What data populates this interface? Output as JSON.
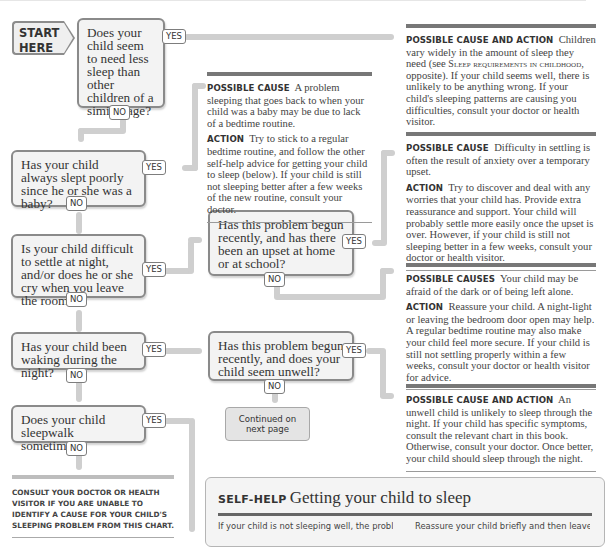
{
  "start": {
    "line1": "START",
    "line2": "HERE"
  },
  "questions": [
    {
      "id": "q1",
      "text": "Does your child seem to need less sleep than other children of a similar age?",
      "yes": "YES",
      "no": "NO"
    },
    {
      "id": "q2",
      "text": "Has your child always slept poorly since he or she was a baby?",
      "yes": "YES",
      "no": "NO"
    },
    {
      "id": "q3",
      "text": "Is your child difficult to settle at night, and/or does he or she cry when you leave the room?",
      "yes": "YES",
      "no": "NO"
    },
    {
      "id": "q4",
      "text": "Has your child been waking during the night?",
      "yes": "YES",
      "no": "NO"
    },
    {
      "id": "q5",
      "text": "Does your child sleepwalk sometimes?",
      "yes": "YES",
      "no": "NO"
    },
    {
      "id": "q6",
      "text": "Has this problem begun recently, and has there been an upset at home or at school?",
      "yes": "YES",
      "no": "NO"
    },
    {
      "id": "q7",
      "text": "Has this problem begun recently, and does your child seem unwell?",
      "yes": "YES",
      "no": "NO"
    }
  ],
  "advice": {
    "need_less_sleep": {
      "label": "Possible cause and action",
      "text_a": "Children vary widely in the amount of sleep they need (see ",
      "ref": "Sleep requirements in childhood",
      "text_b": ", opposite). If your child seems well, there is unlikely to be anything wrong. If your child's sleeping patterns are causing you difficulties, consult your doctor or health visitor."
    },
    "since_baby": {
      "cause_label": "Possible cause",
      "cause_text": "A problem sleeping that goes back to when your child was a baby may be due to lack of a bedtime routine.",
      "action_label": "Action",
      "action_text": "Try to stick to a regular bedtime routine, and follow the other self-help advice for getting your child to sleep (below). If your child is still not sleeping better after a few weeks of the new routine, consult your doctor."
    },
    "upset": {
      "cause_label": "Possible cause",
      "cause_text": "Difficulty in settling is often the result of anxiety over a temporary upset.",
      "action_label": "Action",
      "action_text": "Try to discover and deal with any worries that your child has. Provide extra reassurance and support. Your child will probably settle more easily once the upset is over. However, if your child is still not sleeping better in a few weeks, consult your doctor or health visitor."
    },
    "afraid": {
      "cause_label": "Possible causes",
      "cause_text": "Your child may be afraid of the dark or of being left alone.",
      "action_label": "Action",
      "action_text": "Reassure your child. A night-light or leaving the bedroom door open may help. A regular bedtime routine may also make your child feel more secure. If your child is still not settling properly within a few weeks, consult your doctor or health visitor for advice."
    },
    "unwell": {
      "label": "Possible cause and action",
      "text": "An unwell child is unlikely to sleep through the night. If your child has specific symptoms, consult the relevant chart in this book. Otherwise, consult your doctor. Once better, your child should sleep through the night."
    }
  },
  "continued": {
    "line1": "Continued on",
    "line2": "next page"
  },
  "consult_note": "Consult your doctor or health visitor if you are unable to identify a cause for your child's sleeping problem from this chart.",
  "self_help": {
    "keyword": "Self-help",
    "title": "Getting your child to sleep",
    "col1": "If your child is not sleeping well, the problem",
    "col2": "Reassure your child briefly and then leave"
  }
}
